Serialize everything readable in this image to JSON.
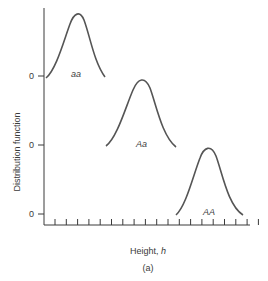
{
  "chart_data": {
    "type": "line",
    "title": "",
    "caption": "(a)",
    "xlabel": "Height, h",
    "xlabel_prefix": "Height, ",
    "xlabel_var": "h",
    "ylabel": "Distribution function",
    "x_ticks_count": 20,
    "grid": false,
    "legend": "none",
    "series": [
      {
        "name": "aa",
        "baseline_label": "0",
        "center_tick": 3,
        "shape": "normal"
      },
      {
        "name": "Aa",
        "baseline_label": "0",
        "center_tick": 9,
        "shape": "normal"
      },
      {
        "name": "AA",
        "baseline_label": "0",
        "center_tick": 15,
        "shape": "normal"
      }
    ]
  },
  "colors": {
    "line": "#555555",
    "axis": "#3a3a3a"
  }
}
